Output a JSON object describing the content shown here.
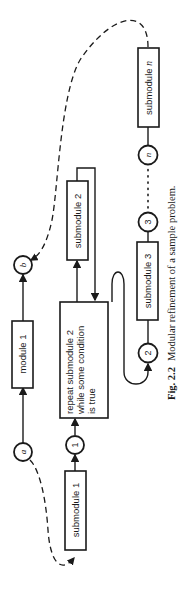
{
  "diagram": {
    "orientation": "rotated 90° counter-clockwise",
    "nodes": {
      "module_1": "module 1",
      "submodule_1": "submodule 1",
      "submodule_2": "submodule 2",
      "submodule_3": "submodule 3",
      "submodule_n_prefix": "submodule ",
      "submodule_n_var": "n",
      "repeat_line1": "repeat submodule 2",
      "repeat_line2": "while some condition",
      "repeat_line3": "is true"
    },
    "connectors": {
      "a": "a",
      "b": "b",
      "c1": "1",
      "c2": "2",
      "c3": "3",
      "cn": "n"
    },
    "caption": {
      "label": "Fig. 2.2",
      "text": "Modular refinement of a sample problem."
    },
    "colors": {
      "ink": "#1a1a1a",
      "background": "#ffffff"
    }
  }
}
